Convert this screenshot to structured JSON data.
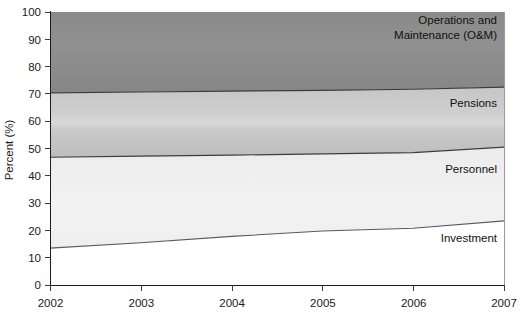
{
  "chart_data": {
    "type": "area",
    "title": "",
    "subtitle": "",
    "xlabel": "",
    "ylabel": "Percent (%)",
    "stacked": true,
    "normalized_to_100": true,
    "grid": false,
    "legend_position": "inline-right",
    "x": [
      2002,
      2003,
      2004,
      2005,
      2006,
      2007
    ],
    "xlim": [
      2002,
      2007
    ],
    "ylim": [
      0,
      100
    ],
    "x_tick_labels": [
      "2002",
      "2003",
      "2004",
      "2005",
      "2006",
      "2007"
    ],
    "y_tick_labels": [
      "0",
      "10",
      "20",
      "30",
      "40",
      "50",
      "60",
      "70",
      "80",
      "90",
      "100"
    ],
    "y_ticks": [
      0,
      10,
      20,
      30,
      40,
      50,
      60,
      70,
      80,
      90,
      100
    ],
    "series": [
      {
        "name": "Investment",
        "label": "Investment",
        "color": "#ffffff",
        "values": [
          13.5,
          15.5,
          17.8,
          19.8,
          20.8,
          23.5
        ],
        "cumulative_top": [
          13.5,
          15.5,
          17.8,
          19.8,
          20.8,
          23.5
        ]
      },
      {
        "name": "Personnel",
        "label": "Personnel",
        "color": "#eeeeee",
        "values": [
          33.3,
          31.7,
          29.8,
          28.2,
          27.7,
          27.0
        ],
        "cumulative_top": [
          46.8,
          47.2,
          47.6,
          48.0,
          48.5,
          50.5
        ]
      },
      {
        "name": "Pensions",
        "label": "Pensions",
        "color": "#c2c2c2",
        "values": [
          23.6,
          23.5,
          23.4,
          23.3,
          23.2,
          22.0
        ],
        "cumulative_top": [
          70.4,
          70.7,
          71.0,
          71.3,
          71.7,
          72.5
        ]
      },
      {
        "name": "Operations and Maintenance (O&M)",
        "label_line1": "Operations and",
        "label_line2": "Maintenance (O&M)",
        "color": "#8c8c8c",
        "values": [
          29.6,
          29.3,
          29.0,
          28.7,
          28.3,
          27.5
        ],
        "cumulative_top": [
          100,
          100,
          100,
          100,
          100,
          100
        ]
      }
    ]
  },
  "axes": {
    "y_axis_title": "Percent (%)",
    "y_ticks": [
      "100",
      "90",
      "80",
      "70",
      "60",
      "50",
      "40",
      "30",
      "20",
      "10",
      "0"
    ],
    "x_ticks": [
      "2002",
      "2003",
      "2004",
      "2005",
      "2006",
      "2007"
    ]
  },
  "annotations": {
    "om_line1": "Operations and",
    "om_line2": "Maintenance (O&M)",
    "pensions": "Pensions",
    "personnel": "Personnel",
    "investment": "Investment"
  }
}
